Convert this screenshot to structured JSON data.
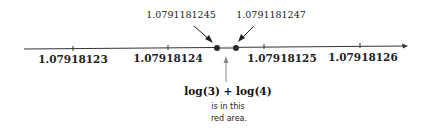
{
  "axis": {
    "ticks": [
      {
        "label": "1.07918123",
        "x": 73
      },
      {
        "label": "1.07918124",
        "x": 168
      },
      {
        "label": "1.07918125",
        "x": 264
      },
      {
        "label": "1.07918126",
        "x": 360
      }
    ]
  },
  "points": [
    {
      "label": "1.0791181245",
      "x": 217
    },
    {
      "label": "1.0791181247",
      "x": 236
    }
  ],
  "annotation": {
    "formula": "log(3) + log(4)",
    "line1": "is in this",
    "line2": "red area."
  },
  "colors": {
    "axis": "#333333",
    "dots": "#2a2a2a",
    "arrow": "#888888",
    "region": "#999999"
  }
}
